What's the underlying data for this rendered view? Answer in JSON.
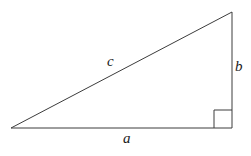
{
  "figure": {
    "kind": "right-triangle-diagram",
    "background_color": "#ffffff",
    "stroke_color": "#3c3c3c",
    "label_color": "#1a1a1a",
    "labels": {
      "hypotenuse": "c",
      "base": "a",
      "height": "b"
    },
    "geometry": {
      "vertices": {
        "left": [
          11,
          128
        ],
        "bottom_right": [
          232,
          128
        ],
        "top_right": [
          232,
          12
        ]
      },
      "right_angle_marker": {
        "corner": [
          232,
          128
        ],
        "size": 18
      },
      "stroke_width": 1
    }
  }
}
